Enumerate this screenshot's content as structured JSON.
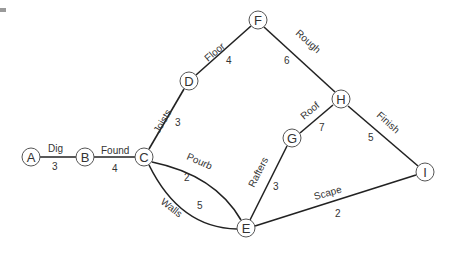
{
  "diagram": {
    "type": "activity-network",
    "colors": {
      "edge": "#222222",
      "node_stroke": "#555555",
      "node_fill": "#ffffff",
      "text": "#333333"
    },
    "nodes": [
      {
        "id": "A",
        "label": "A",
        "x": 31,
        "y": 157
      },
      {
        "id": "B",
        "label": "B",
        "x": 85,
        "y": 157
      },
      {
        "id": "C",
        "label": "C",
        "x": 144,
        "y": 157
      },
      {
        "id": "D",
        "label": "D",
        "x": 189,
        "y": 81
      },
      {
        "id": "F",
        "label": "F",
        "x": 258,
        "y": 20
      },
      {
        "id": "H",
        "label": "H",
        "x": 341,
        "y": 99
      },
      {
        "id": "G",
        "label": "G",
        "x": 292,
        "y": 138
      },
      {
        "id": "I",
        "label": "I",
        "x": 425,
        "y": 172
      },
      {
        "id": "E",
        "label": "E",
        "x": 246,
        "y": 228
      }
    ],
    "edges": [
      {
        "from": "A",
        "to": "B",
        "label": "Dig",
        "weight": "3"
      },
      {
        "from": "B",
        "to": "C",
        "label": "Found",
        "weight": "4"
      },
      {
        "from": "C",
        "to": "D",
        "label": "Joists",
        "weight": "3"
      },
      {
        "from": "D",
        "to": "F",
        "label": "Floor",
        "weight": "4"
      },
      {
        "from": "F",
        "to": "H",
        "label": "Rough",
        "weight": "6"
      },
      {
        "from": "G",
        "to": "H",
        "label": "Roof",
        "weight": "7"
      },
      {
        "from": "H",
        "to": "I",
        "label": "Finish",
        "weight": "5"
      },
      {
        "from": "C",
        "to": "E",
        "label": "Pourb",
        "weight": "2"
      },
      {
        "from": "C",
        "to": "E",
        "label": "Walls",
        "weight": "5"
      },
      {
        "from": "E",
        "to": "G",
        "label": "Rafters",
        "weight": "3"
      },
      {
        "from": "E",
        "to": "I",
        "label": "Scape",
        "weight": "2"
      }
    ]
  }
}
